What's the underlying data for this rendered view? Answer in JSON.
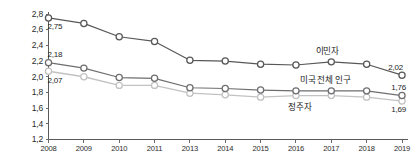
{
  "chart_data": {
    "type": "line",
    "title": "",
    "subtitle": "",
    "xlabel": "",
    "ylabel": "",
    "categories": [
      "2008",
      "2009",
      "2010",
      "2011",
      "2013",
      "2014",
      "2015",
      "2016",
      "2017",
      "2018",
      "2019"
    ],
    "ylim": [
      1.2,
      2.8
    ],
    "ytick_values": [
      1.2,
      1.4,
      1.6,
      1.8,
      2.0,
      2.2,
      2.4,
      2.6,
      2.8
    ],
    "ytick_labels": [
      "1,2",
      "1,4",
      "1,6",
      "1,8",
      "2,0",
      "2,2",
      "2,4",
      "2,6",
      "2,8"
    ],
    "decimal_separator": ",",
    "grid": false,
    "legend_position": "inline-annotations",
    "series": [
      {
        "name": "이민자",
        "label": "이민자",
        "color": "#58585a",
        "marker": "open-circle",
        "marker_fill": "#ffffff",
        "values": [
          2.75,
          2.68,
          2.51,
          2.45,
          2.21,
          2.2,
          2.16,
          2.15,
          2.19,
          2.16,
          2.02
        ],
        "start_label": "2,75",
        "end_label": "2,02"
      },
      {
        "name": "미국 전체 인구",
        "label": "미국 전체 인구",
        "color": "#6e6e70",
        "marker": "open-circle",
        "marker_fill": "#ffffff",
        "values": [
          2.18,
          2.11,
          1.99,
          1.98,
          1.86,
          1.85,
          1.83,
          1.82,
          1.82,
          1.82,
          1.76
        ],
        "start_label": "2,18",
        "end_label": "1,76"
      },
      {
        "name": "정주자",
        "label": "정주자",
        "color": "#c2c2c4",
        "marker": "open-circle",
        "marker_fill": "#ffffff",
        "values": [
          2.07,
          2.0,
          1.89,
          1.89,
          1.79,
          1.77,
          1.74,
          1.76,
          1.76,
          1.74,
          1.69
        ],
        "start_label": "2,07",
        "end_label": "1,69"
      }
    ],
    "annotations": [
      {
        "text": "이민자",
        "series": "이민자",
        "anchor_category": "2017"
      },
      {
        "text": "미국 전체 인구",
        "series": "미국 전체 인구",
        "anchor_category": "2017"
      },
      {
        "text": "정주자",
        "series": "정주자",
        "anchor_category": "2016"
      }
    ]
  },
  "colors": {
    "axis": "#5a5a5a",
    "text": "#1c1c1c",
    "background": "#ffffff",
    "series_immigrant": "#58585a",
    "series_total": "#6e6e70",
    "series_native": "#c2c2c4"
  }
}
